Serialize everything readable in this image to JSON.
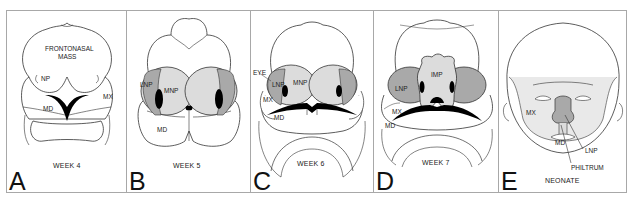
{
  "figure": {
    "colors": {
      "line": "#333333",
      "stipple_light": "#dcdcdc",
      "stipple_dark": "#a9a9a9",
      "fill_black": "#000000",
      "border": "#a8a8a8"
    },
    "panels": [
      {
        "letter": "A",
        "stage": "WEEK 4",
        "labels": {
          "frontonasal1": "FRONTONASAL",
          "frontonasal2": "MASS",
          "np": "NP",
          "st": "ST",
          "mx": "MX",
          "md": "MD"
        }
      },
      {
        "letter": "B",
        "stage": "WEEK 5",
        "labels": {
          "lnp": "LNP",
          "mnp": "MNP",
          "md": "MD"
        }
      },
      {
        "letter": "C",
        "stage": "WEEK 6",
        "labels": {
          "eye": "EYE",
          "lnp": "LNP",
          "mnp": "MNP",
          "mx": "MX",
          "md": "MD"
        }
      },
      {
        "letter": "D",
        "stage": "WEEK 7",
        "labels": {
          "lnp": "LNP",
          "imp": "IMP",
          "mx": "MX",
          "md": "MD"
        }
      },
      {
        "letter": "E",
        "stage": "NEONATE",
        "labels": {
          "mx": "MX",
          "md": "MD",
          "lnp": "LNP",
          "philtrum": "PHILTRUM"
        }
      }
    ]
  }
}
